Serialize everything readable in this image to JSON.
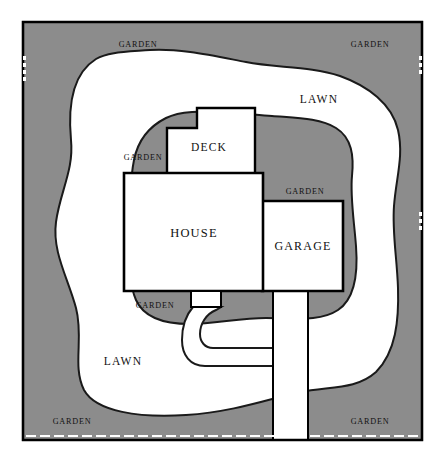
{
  "diagram": {
    "type": "landscape-site-plan",
    "colors": {
      "garden_fill": "#8c8c8c",
      "lawn_fill": "#ffffff",
      "structure_fill": "#ffffff",
      "outline": "#000000",
      "page_background": "#ffffff",
      "property_line": "#000000",
      "dash_mark": "#ffffff"
    },
    "canvas": {
      "width": 444,
      "height": 461,
      "plot_left": 23,
      "plot_top": 22,
      "plot_right": 422,
      "plot_bottom": 440
    }
  },
  "structures": [
    {
      "id": "deck",
      "label": "DECK",
      "label_x": 209,
      "label_y": 148
    },
    {
      "id": "house",
      "label": "HOUSE",
      "label_x": 194,
      "label_y": 234
    },
    {
      "id": "garage",
      "label": "GARAGE",
      "label_x": 303,
      "label_y": 247
    },
    {
      "id": "porch",
      "label": "",
      "label_x": 0,
      "label_y": 0
    },
    {
      "id": "driveway",
      "label": "",
      "label_x": 0,
      "label_y": 0
    },
    {
      "id": "walkway",
      "label": "",
      "label_x": 0,
      "label_y": 0
    }
  ],
  "area_labels": [
    {
      "id": "garden-top-left",
      "text": "GARDEN",
      "x": 138,
      "y": 45,
      "cls": "label-garden"
    },
    {
      "id": "garden-top-right",
      "text": "GARDEN",
      "x": 370,
      "y": 45,
      "cls": "label-garden"
    },
    {
      "id": "lawn-upper-right",
      "text": "LAWN",
      "x": 319,
      "y": 100,
      "cls": "label-lawn"
    },
    {
      "id": "garden-mid-left",
      "text": "GARDEN",
      "x": 143,
      "y": 158,
      "cls": "label-garden"
    },
    {
      "id": "garden-mid-right",
      "text": "GARDEN",
      "x": 305,
      "y": 192,
      "cls": "label-garden"
    },
    {
      "id": "garden-lower-left",
      "text": "GARDEN",
      "x": 155,
      "y": 306,
      "cls": "label-garden"
    },
    {
      "id": "lawn-lower-left",
      "text": "LAWN",
      "x": 123,
      "y": 362,
      "cls": "label-lawn"
    },
    {
      "id": "garden-bottom-left",
      "text": "GARDEN",
      "x": 72,
      "y": 422,
      "cls": "label-garden"
    },
    {
      "id": "garden-bottom-right",
      "text": "GARDEN",
      "x": 370,
      "y": 422,
      "cls": "label-garden"
    }
  ],
  "geometry": {
    "property_border": "M23,22 L422,22 L422,440 L23,440 Z",
    "lawn_outer": "M23,22 L422,22 L422,440 L23,440 Z",
    "lawn_blob_main": "M96,59 C72,74 68,108 71,140 C74,170 60,192 56,222 C52,252 68,278 76,308 C84,338 72,366 84,390 C96,412 140,418 186,415 C234,412 272,398 300,392 C330,386 356,390 376,372 C396,352 399,320 398,288 C397,258 392,232 394,206 C396,178 404,156 398,130 C392,104 368,86 340,76 C310,66 276,68 246,62 C214,56 178,48 150,50 C124,52 108,52 96,59 Z",
    "lawn_notch_struct": "M166,118 C150,126 138,140 134,160 C130,180 130,206 130,232 C130,258 128,282 136,300 C144,318 166,324 190,324 C214,324 240,318 266,318 C294,318 320,322 338,310 C356,298 358,272 356,246 C354,220 350,196 352,176 C354,156 352,138 336,128 C320,118 296,118 272,116 C246,114 216,110 192,112 C178,113 172,115 166,118 Z",
    "deck_outline": "M197,108 L255,108 L255,174 L167,174 L167,128 L197,128 Z",
    "house_outline": "M124,173 L263,173 L263,291 L124,291 Z",
    "garage_outline": "M262,201 L343,201 L343,291 L262,291 Z",
    "porch_outline": "M191,291 L221,291 L221,307 L191,307 Z",
    "driveway_outline": "M273,291 L308,291 L308,440 L273,440 Z",
    "walkway_outline": "M193,307 C186,315 182,326 182,340 C182,355 190,366 205,366 L273,366 L273,348 L213,348 C205,348 200,342 200,334 C200,324 206,314 216,310 L221,307 Z"
  },
  "dash_marks": {
    "left_edge": [
      {
        "x": 23,
        "y": 56,
        "w": 3,
        "h": 4
      },
      {
        "x": 23,
        "y": 63,
        "w": 3,
        "h": 4
      },
      {
        "x": 23,
        "y": 70,
        "w": 3,
        "h": 4
      },
      {
        "x": 23,
        "y": 77,
        "w": 3,
        "h": 4
      }
    ],
    "right_edge": [
      {
        "x": 419,
        "y": 56,
        "w": 3,
        "h": 4
      },
      {
        "x": 419,
        "y": 63,
        "w": 3,
        "h": 4
      },
      {
        "x": 419,
        "y": 70,
        "w": 3,
        "h": 4
      },
      {
        "x": 419,
        "y": 212,
        "w": 3,
        "h": 4
      },
      {
        "x": 419,
        "y": 219,
        "w": 3,
        "h": 4
      },
      {
        "x": 419,
        "y": 226,
        "w": 3,
        "h": 4
      }
    ],
    "bottom_edge": [
      {
        "x": 26,
        "y": 435,
        "w": 10,
        "h": 2
      },
      {
        "x": 40,
        "y": 435,
        "w": 10,
        "h": 2
      },
      {
        "x": 54,
        "y": 435,
        "w": 10,
        "h": 2
      },
      {
        "x": 68,
        "y": 435,
        "w": 10,
        "h": 2
      },
      {
        "x": 82,
        "y": 435,
        "w": 10,
        "h": 2
      },
      {
        "x": 96,
        "y": 435,
        "w": 10,
        "h": 2
      },
      {
        "x": 110,
        "y": 435,
        "w": 10,
        "h": 2
      },
      {
        "x": 124,
        "y": 435,
        "w": 10,
        "h": 2
      },
      {
        "x": 138,
        "y": 435,
        "w": 10,
        "h": 2
      },
      {
        "x": 152,
        "y": 435,
        "w": 10,
        "h": 2
      },
      {
        "x": 166,
        "y": 435,
        "w": 10,
        "h": 2
      },
      {
        "x": 180,
        "y": 435,
        "w": 10,
        "h": 2
      },
      {
        "x": 194,
        "y": 435,
        "w": 10,
        "h": 2
      },
      {
        "x": 208,
        "y": 435,
        "w": 10,
        "h": 2
      },
      {
        "x": 222,
        "y": 435,
        "w": 10,
        "h": 2
      },
      {
        "x": 236,
        "y": 435,
        "w": 10,
        "h": 2
      },
      {
        "x": 250,
        "y": 435,
        "w": 10,
        "h": 2
      },
      {
        "x": 264,
        "y": 435,
        "w": 10,
        "h": 2
      },
      {
        "x": 278,
        "y": 435,
        "w": 10,
        "h": 2
      },
      {
        "x": 292,
        "y": 435,
        "w": 10,
        "h": 2
      },
      {
        "x": 310,
        "y": 435,
        "w": 10,
        "h": 2
      },
      {
        "x": 324,
        "y": 435,
        "w": 10,
        "h": 2
      },
      {
        "x": 338,
        "y": 435,
        "w": 10,
        "h": 2
      },
      {
        "x": 352,
        "y": 435,
        "w": 10,
        "h": 2
      },
      {
        "x": 366,
        "y": 435,
        "w": 10,
        "h": 2
      },
      {
        "x": 380,
        "y": 435,
        "w": 10,
        "h": 2
      },
      {
        "x": 394,
        "y": 435,
        "w": 10,
        "h": 2
      },
      {
        "x": 408,
        "y": 435,
        "w": 10,
        "h": 2
      }
    ]
  }
}
